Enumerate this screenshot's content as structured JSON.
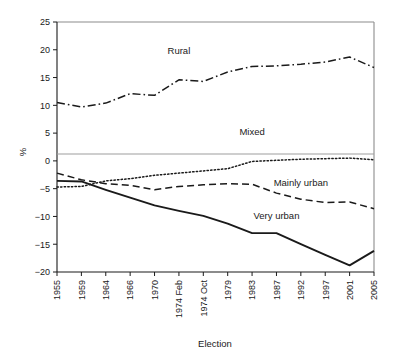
{
  "chart_data": {
    "type": "line",
    "title": "",
    "xlabel": "Election",
    "ylabel": "%",
    "ylim": [
      -20,
      25
    ],
    "yticks": [
      -20,
      -15,
      -10,
      -5,
      0,
      5,
      10,
      15,
      20,
      25
    ],
    "ytick_labels": [
      "−20",
      "−15",
      "−10",
      "−5",
      "0",
      "5",
      "10",
      "15",
      "20",
      "25"
    ],
    "grid": false,
    "legend": "inline-annotations",
    "categories": [
      "1955",
      "1959",
      "1964",
      "1966",
      "1970",
      "1974 Feb",
      "1974 Oct",
      "1979",
      "1983",
      "1987",
      "1992",
      "1997",
      "2001",
      "2005"
    ],
    "series": [
      {
        "name": "Rural",
        "style": "dash-dot",
        "color": "#1a1a1a",
        "values": [
          10.5,
          9.7,
          10.4,
          12.1,
          11.8,
          14.6,
          14.3,
          16.0,
          17.0,
          17.1,
          17.4,
          17.8,
          18.7,
          16.8
        ]
      },
      {
        "name": "Mixed",
        "style": "dotted",
        "color": "#1a1a1a",
        "values": [
          -4.7,
          -4.6,
          -3.6,
          -3.2,
          -2.6,
          -2.2,
          -1.8,
          -1.4,
          -0.1,
          0.1,
          0.3,
          0.4,
          0.5,
          0.2
        ]
      },
      {
        "name": "Mainly urban",
        "style": "dashed",
        "color": "#1a1a1a",
        "values": [
          -2.2,
          -3.4,
          -4.1,
          -4.4,
          -5.2,
          -4.6,
          -4.3,
          -4.1,
          -4.2,
          -5.8,
          -6.9,
          -7.5,
          -7.4,
          -8.6
        ]
      },
      {
        "name": "Very urban",
        "style": "solid",
        "color": "#1a1a1a",
        "values": [
          -3.6,
          -3.7,
          -5.2,
          -6.6,
          -8.0,
          -9.0,
          -9.9,
          -11.3,
          -13.0,
          -13.0,
          -15.0,
          -16.9,
          -18.8,
          -16.2
        ]
      }
    ],
    "annotations": [
      {
        "text": "Rural",
        "x": "1974 Feb",
        "y": 19.3
      },
      {
        "text": "Mixed",
        "x": "1983",
        "y": 4.6
      },
      {
        "text": "Mainly urban",
        "x": "1992",
        "y": -4.6
      },
      {
        "text": "Very urban",
        "x": "1987",
        "y": -10.4
      }
    ]
  },
  "axes": {
    "y_label": "%",
    "x_label": "Election"
  }
}
